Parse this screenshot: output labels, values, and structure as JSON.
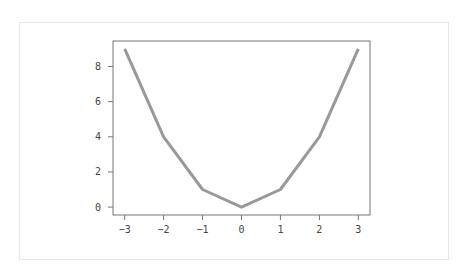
{
  "chart_data": {
    "type": "line",
    "title": "",
    "xlabel": "",
    "ylabel": "",
    "x": [
      -3,
      -2,
      -1,
      0,
      1,
      2,
      3
    ],
    "series": [
      {
        "name": "y = x^2",
        "values": [
          9,
          4,
          1,
          0,
          1,
          4,
          9
        ],
        "color": "#999999"
      }
    ],
    "xticks": [
      "−3",
      "−2",
      "−1",
      "0",
      "1",
      "2",
      "3"
    ],
    "yticks": [
      "0",
      "2",
      "4",
      "6",
      "8"
    ],
    "xlim": [
      -3.3,
      3.3
    ],
    "ylim": [
      -0.45,
      9.45
    ],
    "grid": false,
    "legend": null
  }
}
